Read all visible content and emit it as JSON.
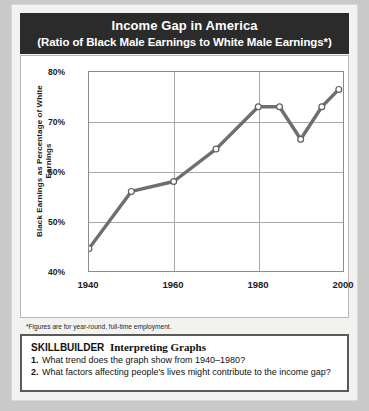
{
  "title": {
    "main": "Income Gap in America",
    "sub": "(Ratio of Black Male Earnings to White Male Earnings*)"
  },
  "chart_data": {
    "type": "line",
    "title": "Income Gap in America",
    "subtitle": "(Ratio of Black Male Earnings to White Male Earnings*)",
    "xlabel": "",
    "ylabel": "Black Earnings as Percentage of White Earnings",
    "xlim": [
      1940,
      2000
    ],
    "ylim": [
      40,
      80
    ],
    "xticks": [
      "1940",
      "1960",
      "1980",
      "2000"
    ],
    "xtick_values": [
      1940,
      1960,
      1980,
      2000
    ],
    "yticks": [
      "40%",
      "50%",
      "60%",
      "70%",
      "80%"
    ],
    "ytick_values": [
      40,
      50,
      60,
      70,
      80
    ],
    "grid": true,
    "legend": "none",
    "marker": "open-circle",
    "line_color": "#6e6e6e",
    "x": [
      1940,
      1950,
      1960,
      1970,
      1980,
      1985,
      1990,
      1995,
      1999
    ],
    "values": [
      44.5,
      56.0,
      58.0,
      64.5,
      73.0,
      73.0,
      66.5,
      73.0,
      76.5
    ]
  },
  "footnotes": {
    "asterisk": "*Figures are for year-round, full-time employment.",
    "source_prefix": "Source: ",
    "source_title": "The First Measured Century",
    "source_rest": ", Theodore Caplow, 2001"
  },
  "skillbuilder": {
    "label": "SKILLBUILDER",
    "heading": "Interpreting Graphs",
    "questions": [
      {
        "num": "1.",
        "text": "What trend does the graph show from 1940–1980?"
      },
      {
        "num": "2.",
        "text": "What factors affecting people's lives might contribute to the income gap?"
      }
    ]
  }
}
